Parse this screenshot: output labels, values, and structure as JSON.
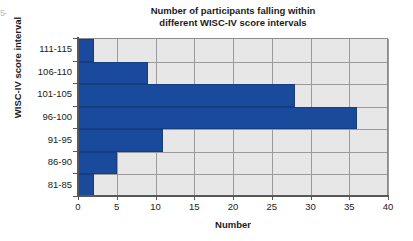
{
  "figure": {
    "edge_artifact_text": "5-"
  },
  "chart_data": {
    "type": "bar",
    "orientation": "horizontal",
    "title": "Number of participants falling within different WISC-IV score intervals",
    "title_line1": "Number of participants falling within",
    "title_line2": "different WISC-IV score intervals",
    "xlabel": "Number",
    "ylabel": "WISC-IV score interval",
    "categories": [
      "81-85",
      "86-90",
      "91-95",
      "96-100",
      "101-105",
      "106-110",
      "111-115"
    ],
    "categories_top_to_bottom": [
      "111-115",
      "106-110",
      "101-105",
      "96-100",
      "91-95",
      "86-90",
      "81-85"
    ],
    "values": [
      2,
      5,
      11,
      36,
      28,
      9,
      2
    ],
    "values_top_to_bottom": [
      2,
      9,
      28,
      36,
      11,
      5,
      2
    ],
    "xlim": [
      0,
      40
    ],
    "xticks": [
      0,
      5,
      10,
      15,
      20,
      25,
      30,
      35,
      40
    ],
    "xtick_labels": [
      "0",
      "5",
      "10",
      "15",
      "20",
      "25",
      "30",
      "35",
      "40"
    ],
    "grid": true,
    "grid_axis": "both",
    "legend": false,
    "bar_color": "#1a4a9c",
    "plot_background": "#e7e7e7",
    "gridline_color": "#9a9a9a",
    "axis_color": "#585858",
    "total_participants": 93
  }
}
